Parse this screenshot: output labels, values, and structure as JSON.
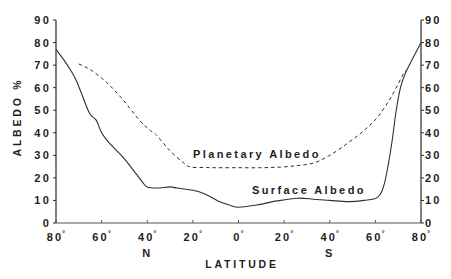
{
  "chart_data": {
    "type": "line",
    "title": "",
    "xlabel": "LATITUDE",
    "ylabel": "ALBEDO %",
    "x_direction_labels": {
      "north": "N",
      "south": "S"
    },
    "xlim": [
      80,
      -80
    ],
    "x_note": "latitude in degrees, positive = North, negative = South; axis runs 80°N (left) to 80°S (right)",
    "x_ticks": [
      80,
      60,
      40,
      20,
      0,
      -20,
      -40,
      -60,
      -80
    ],
    "x_tick_labels": [
      "80",
      "60",
      "40",
      "20",
      "0",
      "20",
      "40",
      "60",
      "80"
    ],
    "degree_symbol": "°",
    "ylim": [
      0,
      90
    ],
    "y_ticks": [
      0,
      10,
      20,
      30,
      40,
      50,
      60,
      70,
      80,
      90
    ],
    "y_tick_labels": [
      "0",
      "10",
      "20",
      "30",
      "40",
      "50",
      "60",
      "70",
      "80",
      "90"
    ],
    "y_axis_both_sides": true,
    "grid": false,
    "legend": "none (inline curve labels)",
    "series": [
      {
        "name": "Surface Albedo",
        "style": "solid",
        "label_pos": {
          "x": 252,
          "y": 194
        },
        "x": [
          80,
          75,
          71,
          65.5,
          62.4,
          60,
          56.7,
          50.5,
          45,
          42,
          40,
          36,
          30,
          27,
          20,
          15,
          9,
          4,
          0,
          -8,
          -17,
          -26,
          -33,
          -40,
          -48,
          -55,
          -61,
          -64,
          -67,
          -69,
          -71,
          -73.4,
          -80
        ],
        "values": [
          77,
          70,
          63,
          49,
          45.6,
          40,
          35.5,
          29,
          22,
          18,
          16,
          15.5,
          16,
          15.5,
          14.5,
          13,
          9.8,
          8,
          7,
          8,
          9.8,
          11,
          10.5,
          10,
          9.5,
          10,
          11.5,
          17.7,
          34,
          49,
          60,
          67,
          80
        ]
      },
      {
        "name": "Planetary Albedo",
        "style": "dashed",
        "label_pos": {
          "x": 193,
          "y": 158
        },
        "x": [
          70,
          65,
          58,
          50.5,
          43.5,
          38.7,
          36,
          30,
          24,
          21,
          15,
          10,
          0,
          -10,
          -18.5,
          -26,
          -33,
          -40,
          -48,
          -55,
          -61,
          -67,
          -72.5,
          -73.4
        ],
        "values": [
          70.5,
          68,
          62.5,
          54.5,
          45.6,
          41,
          39,
          32,
          26.6,
          24.8,
          24.6,
          24.5,
          24.5,
          24.5,
          24.8,
          25.5,
          26.6,
          30,
          35.5,
          41,
          47,
          56,
          66.5,
          67
        ]
      }
    ]
  },
  "colors": {
    "background": "#ffffff",
    "axis": "#2a2a2a",
    "line": "#2f2f2f",
    "text": "#1e1e1e"
  }
}
